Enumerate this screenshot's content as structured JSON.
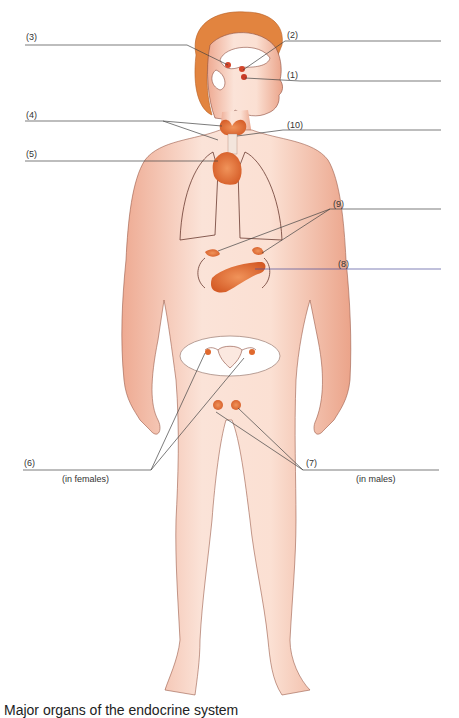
{
  "diagram": {
    "labels": [
      {
        "id": "1",
        "text": "(1)",
        "x": 287,
        "y": 70,
        "organ": "pituitary-gland"
      },
      {
        "id": "2",
        "text": "(2)",
        "x": 287,
        "y": 30,
        "organ": "hypothalamus"
      },
      {
        "id": "3",
        "text": "(3)",
        "x": 26,
        "y": 32,
        "organ": "pineal-gland"
      },
      {
        "id": "4",
        "text": "(4)",
        "x": 26,
        "y": 110,
        "organ": "parathyroid-glands"
      },
      {
        "id": "5",
        "text": "(5)",
        "x": 26,
        "y": 149,
        "organ": "thymus"
      },
      {
        "id": "6",
        "text": "(6)",
        "x": 24,
        "y": 458,
        "organ": "ovaries"
      },
      {
        "id": "7",
        "text": "(7)",
        "x": 306,
        "y": 458,
        "organ": "testes"
      },
      {
        "id": "8",
        "text": "(8)",
        "x": 338,
        "y": 259,
        "organ": "pancreas"
      },
      {
        "id": "9",
        "text": "(9)",
        "x": 333,
        "y": 199,
        "organ": "adrenal-glands"
      },
      {
        "id": "10",
        "text": "(10)",
        "x": 287,
        "y": 120,
        "organ": "thyroid-gland"
      }
    ],
    "sublabels": {
      "females": "(in females)",
      "males": "(in males)"
    },
    "caption": "Major organs of the endocrine system",
    "colors": {
      "skin": "#f6cdbd",
      "skin_shadow": "#e9a48c",
      "outline": "#8a4a3a",
      "hair": "#e2843f",
      "gland": "#e0692e",
      "gland_dark": "#c9501f",
      "leader_line": "#444444",
      "leader_line_blue": "#4a4a9a"
    }
  }
}
